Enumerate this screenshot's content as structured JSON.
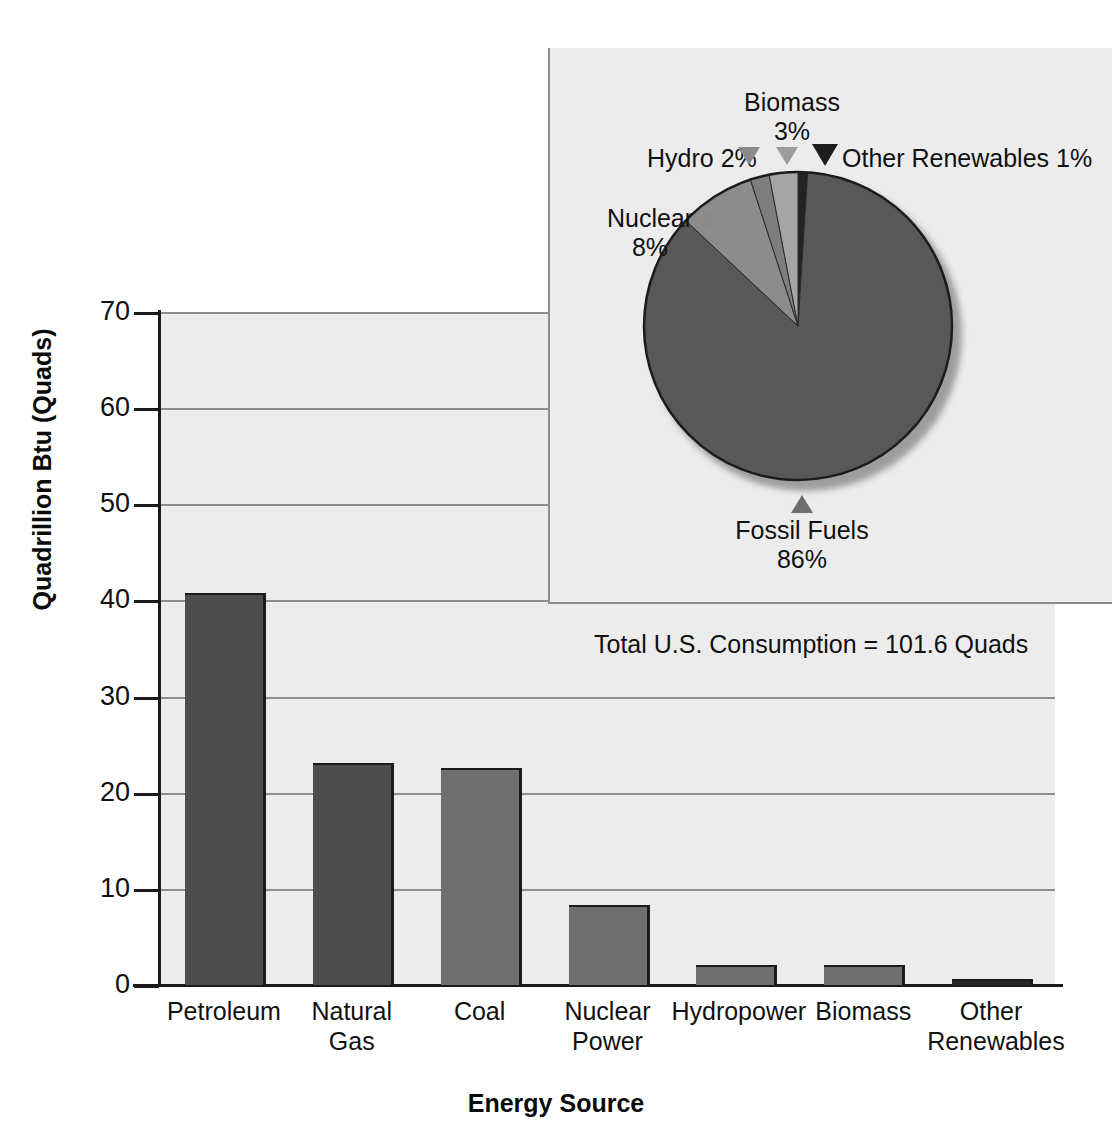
{
  "chart_data": {
    "type": "bar",
    "title": "",
    "xlabel": "Energy Source",
    "ylabel": "Quadrillion Btu (Quads)",
    "categories": [
      "Petroleum",
      "Natural Gas",
      "Coal",
      "Nuclear\nPower",
      "Hydropower",
      "Biomass",
      "Other\nRenewables"
    ],
    "values": [
      40.6,
      22.9,
      22.4,
      8.1,
      1.9,
      1.9,
      0.4
    ],
    "ylim": [
      0,
      70
    ],
    "yticks": [
      0,
      10,
      20,
      30,
      40,
      50,
      60,
      70
    ],
    "grid": "horizontal",
    "legend": "none",
    "bar_colors": [
      "#4d4d4d",
      "#4d4d4d",
      "#6f6f6f",
      "#6f6f6f",
      "#6f6f6f",
      "#6f6f6f",
      "#262626"
    ],
    "annotation": "Total U.S. Consumption = 101.6 Quads",
    "inset_pie": {
      "type": "pie",
      "labels": [
        "Fossil Fuels",
        "Nuclear",
        "Hydro",
        "Biomass",
        "Other Renewables"
      ],
      "values": [
        86,
        8,
        2,
        3,
        1
      ],
      "value_texts": [
        "86%",
        "8%",
        "2%",
        "3%",
        "1%"
      ],
      "colors": [
        "#585858",
        "#8c8c8c",
        "#7e7e7e",
        "#a5a5a5",
        "#232323"
      ]
    }
  },
  "axes": {
    "y_title": "Quadrillion Btu (Quads)",
    "x_title": "Energy Source",
    "y_tick_labels": [
      "70",
      "60",
      "50",
      "40",
      "30",
      "20",
      "10",
      "0"
    ],
    "x_tick_labels": [
      {
        "line1": "Petroleum",
        "line2": ""
      },
      {
        "line1": "Natural Gas",
        "line2": ""
      },
      {
        "line1": "Coal",
        "line2": ""
      },
      {
        "line1": "Nuclear",
        "line2": "Power"
      },
      {
        "line1": "Hydropower",
        "line2": ""
      },
      {
        "line1": "Biomass",
        "line2": ""
      },
      {
        "line1": "Other",
        "line2": "Renewables"
      }
    ]
  },
  "annotations": {
    "total_consumption": "Total U.S. Consumption = 101.6 Quads"
  },
  "pie_labels": {
    "biomass_name": "Biomass",
    "biomass_pct": "3%",
    "hydro": "Hydro 2%",
    "other_renewables": "Other Renewables 1%",
    "nuclear_name": "Nuclear",
    "nuclear_pct": "8%",
    "fossil_name": "Fossil Fuels",
    "fossil_pct": "86%"
  },
  "colors": {
    "plot_background": "#ececed",
    "pie_panel_background": "#ececec",
    "gridline": "#8d8d8d",
    "axis": "#1a1a1a",
    "bar_dark": "#4d4d4d",
    "bar_medium": "#6f6f6f",
    "bar_darkest": "#262626",
    "pie_fossil": "#585858",
    "pie_nuclear": "#8c8c8c",
    "pie_hydro": "#7e7e7e",
    "pie_biomass": "#a5a5a5",
    "pie_other": "#232323"
  }
}
